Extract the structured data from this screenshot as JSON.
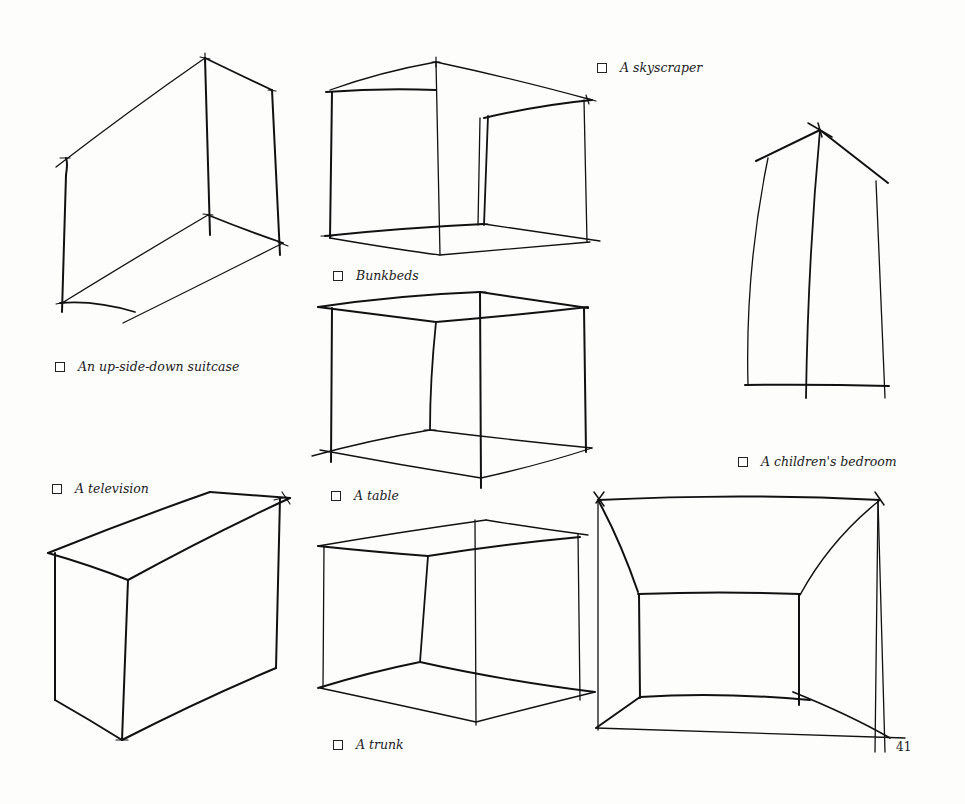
{
  "page": {
    "number": "41",
    "background": "#fdfdfc",
    "ink_color": "#111111"
  },
  "options": [
    {
      "id": "skyscraper",
      "label": "A skyscraper",
      "checked": false
    },
    {
      "id": "bunkbeds",
      "label": "Bunkbeds",
      "checked": false
    },
    {
      "id": "suitcase",
      "label": "An up-side-down suitcase",
      "checked": false
    },
    {
      "id": "childrens-bedroom",
      "label": "A children's bedroom",
      "checked": false
    },
    {
      "id": "television",
      "label": "A television",
      "checked": false
    },
    {
      "id": "table",
      "label": "A table",
      "checked": false
    },
    {
      "id": "trunk",
      "label": "A trunk",
      "checked": false
    }
  ],
  "drawings": [
    {
      "id": "box-top-left",
      "description": "open box sketch, three-quarter view"
    },
    {
      "id": "box-top-center",
      "description": "cube frame sketch"
    },
    {
      "id": "tapered-tower",
      "description": "tall tapered form in perspective"
    },
    {
      "id": "cube-center",
      "description": "open cube frame"
    },
    {
      "id": "box-bottom-left",
      "description": "solid rectangular box"
    },
    {
      "id": "cube-bottom-center",
      "description": "open cube frame"
    },
    {
      "id": "room-interior",
      "description": "one-point perspective room interior"
    }
  ]
}
